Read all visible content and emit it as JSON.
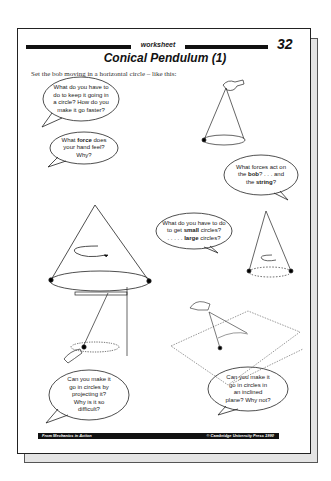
{
  "page": {
    "header_label": "worksheet",
    "page_number": "32",
    "title": "Conical Pendulum (1)",
    "intro": "Set the bob moving in a horizontal circle – like this:"
  },
  "bubbles": [
    {
      "id": "keep-circle",
      "lines": [
        "What do you have to",
        "do to keep it going in",
        "a circle? How do you",
        "make it go faster?"
      ]
    },
    {
      "id": "force-hand",
      "lines": [
        "What force does",
        "your hand feel?",
        "Why?"
      ],
      "bold": "force"
    },
    {
      "id": "forces-bob-string",
      "lines": [
        "What forces act on",
        "the bob? . . . and",
        "the string?"
      ],
      "bold": [
        "bob",
        "string"
      ]
    },
    {
      "id": "small-large",
      "lines": [
        "What do you have to do",
        "to get small circles?",
        ". . . . . large circles?"
      ],
      "bold": [
        "small",
        "large"
      ]
    },
    {
      "id": "projecting",
      "lines": [
        "Can you make it",
        "go in circles by",
        "projecting it?",
        "Why is it so",
        "difficult?"
      ]
    },
    {
      "id": "inclined",
      "lines": [
        "Can you make it",
        "go in circles in",
        "an inclined",
        "plane? Why not?"
      ]
    }
  ],
  "footer": {
    "left": "From Mechanics in Action",
    "right": "© Cambridge University Press 1990"
  },
  "illustrations": [
    "hand-held-conical-pendulum",
    "large-cone-with-rotation-arrow",
    "small-cone-with-rotation-arrow",
    "pendulum-from-beam-hand-projecting",
    "pendulum-on-inclined-plane"
  ]
}
